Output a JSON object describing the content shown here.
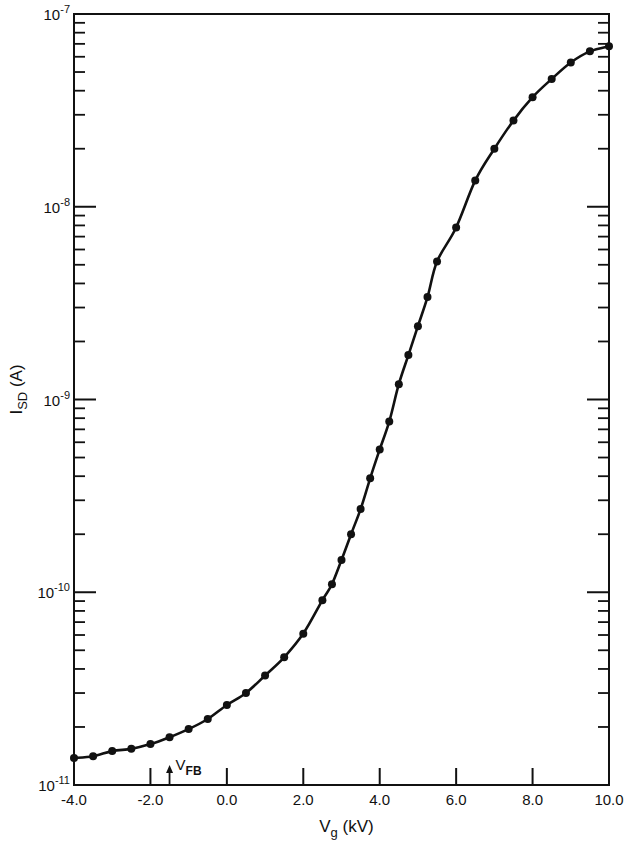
{
  "chart_data": {
    "type": "line",
    "title": "",
    "xlabel": "V_g (kV)",
    "xlabel_main": "V",
    "xlabel_sub": "g",
    "xlabel_unit": "(kV)",
    "ylabel": "I_SD (A)",
    "ylabel_main": "I",
    "ylabel_sub": "SD",
    "ylabel_unit": "(A)",
    "xlim": [
      -4.0,
      10.0
    ],
    "ylim": [
      1e-11,
      1e-07
    ],
    "yscale": "log",
    "grid": false,
    "legend": null,
    "x_ticks": [
      -4.0,
      -2.0,
      0.0,
      2.0,
      4.0,
      6.0,
      8.0,
      10.0
    ],
    "x_tick_labels": [
      "-4.0",
      "-2.0",
      "0.0",
      "2.0",
      "4.0",
      "6.0",
      "8.0",
      "10.0"
    ],
    "y_ticks": [
      1e-11,
      1e-10,
      1e-09,
      1e-08,
      1e-07
    ],
    "y_tick_labels": [
      {
        "base": "10",
        "exp": "-11"
      },
      {
        "base": "10",
        "exp": "-10"
      },
      {
        "base": "10",
        "exp": "-9"
      },
      {
        "base": "10",
        "exp": "-8"
      },
      {
        "base": "10",
        "exp": "-7"
      }
    ],
    "annotations": [
      {
        "text": "V_FB",
        "main": "V",
        "sub": "FB",
        "x": -1.5,
        "type": "arrow-up-at-axis"
      }
    ],
    "series": [
      {
        "name": "I_SD vs V_g",
        "marker": "filled-circle",
        "line": "solid",
        "color": "#111111",
        "x": [
          -4.0,
          -3.5,
          -3.0,
          -2.5,
          -2.0,
          -1.5,
          -1.0,
          -0.5,
          0.0,
          0.5,
          1.0,
          1.5,
          2.0,
          2.5,
          2.75,
          3.0,
          3.25,
          3.5,
          3.75,
          4.0,
          4.25,
          4.5,
          4.75,
          5.0,
          5.25,
          5.5,
          6.0,
          6.5,
          7.0,
          7.5,
          8.0,
          8.5,
          9.0,
          9.5,
          10.0
        ],
        "y": [
          1.38e-11,
          1.41e-11,
          1.5e-11,
          1.54e-11,
          1.63e-11,
          1.77e-11,
          1.95e-11,
          2.2e-11,
          2.6e-11,
          3e-11,
          3.7e-11,
          4.6e-11,
          6.1e-11,
          9.1e-11,
          1.1e-10,
          1.47e-10,
          2e-10,
          2.7e-10,
          3.9e-10,
          5.5e-10,
          7.7e-10,
          1.2e-09,
          1.7e-09,
          2.4e-09,
          3.4e-09,
          5.2e-09,
          7.8e-09,
          1.37e-08,
          2e-08,
          2.8e-08,
          3.7e-08,
          4.6e-08,
          5.6e-08,
          6.4e-08,
          6.8e-08
        ]
      }
    ]
  },
  "colors": {
    "ink": "#111111",
    "background": "#ffffff"
  }
}
